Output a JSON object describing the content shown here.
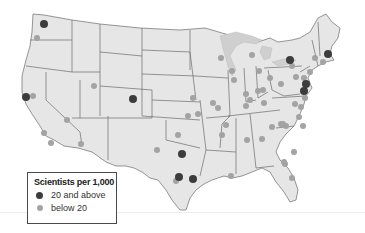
{
  "legend": {
    "title": "Scientists per 1,000",
    "items": [
      {
        "label": "20 and above",
        "color": "#3c3c3c"
      },
      {
        "label": "below 20",
        "color": "#a3a3a3"
      }
    ]
  },
  "colors": {
    "land": "#e6e6e6",
    "border": "#6b6b6b",
    "high": "#3c3c3c",
    "low": "#a3a3a3"
  },
  "points": {
    "high": [
      {
        "region": "Seattle, WA",
        "x": 44,
        "y": 24
      },
      {
        "region": "San Francisco Bay, CA",
        "x": 26,
        "y": 97
      },
      {
        "region": "Denver/Boulder, CO",
        "x": 133,
        "y": 99
      },
      {
        "region": "Dallas, TX",
        "x": 182,
        "y": 161
      },
      {
        "region": "Austin, TX",
        "x": 179,
        "y": 178
      },
      {
        "region": "Houston, TX",
        "x": 193,
        "y": 180
      },
      {
        "region": "Rochester/Syracuse, NY",
        "x": 290,
        "y": 60
      },
      {
        "region": "Boston, MA",
        "x": 328,
        "y": 55
      },
      {
        "region": "New Jersey/Philadelphia",
        "x": 306,
        "y": 85
      },
      {
        "region": "Baltimore/Washington",
        "x": 304,
        "y": 92
      }
    ],
    "low_count": 52
  }
}
